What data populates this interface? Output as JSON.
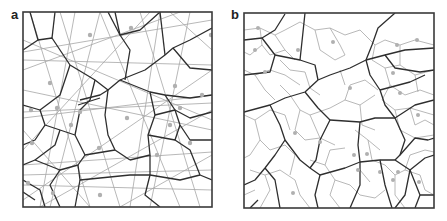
{
  "figure": {
    "panels": [
      {
        "label": "a",
        "description": "Voronoi-like polygonal tessellation (dark boundaries) overlaid with long straight gray lines and gray seed points",
        "frame": {
          "x": 23,
          "y": 12,
          "w": 189,
          "h": 195
        }
      },
      {
        "label": "b",
        "description": "Coarse polygonal tessellation (dark boundaries) with finer sub-cell tessellation (gray boundaries) and gray seed points",
        "frame": {
          "x": 244,
          "y": 13,
          "w": 190,
          "h": 195
        }
      }
    ],
    "colors": {
      "dark_edges": "#2e2e2e",
      "gray_edges": "#a6a6a6",
      "seed_points": "#b0b0b0",
      "background": "#ffffff"
    }
  }
}
